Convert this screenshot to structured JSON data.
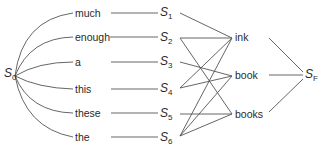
{
  "diagram": {
    "start": {
      "label": "S",
      "sub": "0"
    },
    "final": {
      "label": "S",
      "sub": "F"
    },
    "words": [
      {
        "id": "w1",
        "label": "much"
      },
      {
        "id": "w2",
        "label": "enough"
      },
      {
        "id": "w3",
        "label": "a"
      },
      {
        "id": "w4",
        "label": "this"
      },
      {
        "id": "w5",
        "label": "these"
      },
      {
        "id": "w6",
        "label": "the"
      }
    ],
    "states": [
      {
        "label": "S",
        "sub": "1"
      },
      {
        "label": "S",
        "sub": "2"
      },
      {
        "label": "S",
        "sub": "3"
      },
      {
        "label": "S",
        "sub": "4"
      },
      {
        "label": "S",
        "sub": "5"
      },
      {
        "label": "S",
        "sub": "6"
      }
    ],
    "nouns": [
      {
        "id": "n1",
        "label": "ink"
      },
      {
        "id": "n2",
        "label": "book"
      },
      {
        "id": "n3",
        "label": "books"
      }
    ],
    "edges": [
      [
        "S1",
        "ink"
      ],
      [
        "S2",
        "ink"
      ],
      [
        "S2",
        "books"
      ],
      [
        "S3",
        "book"
      ],
      [
        "S4",
        "ink"
      ],
      [
        "S4",
        "book"
      ],
      [
        "S5",
        "books"
      ],
      [
        "S6",
        "ink"
      ],
      [
        "S6",
        "book"
      ],
      [
        "S6",
        "books"
      ],
      [
        "ink",
        "SF"
      ],
      [
        "book",
        "SF"
      ],
      [
        "books",
        "SF"
      ]
    ]
  }
}
